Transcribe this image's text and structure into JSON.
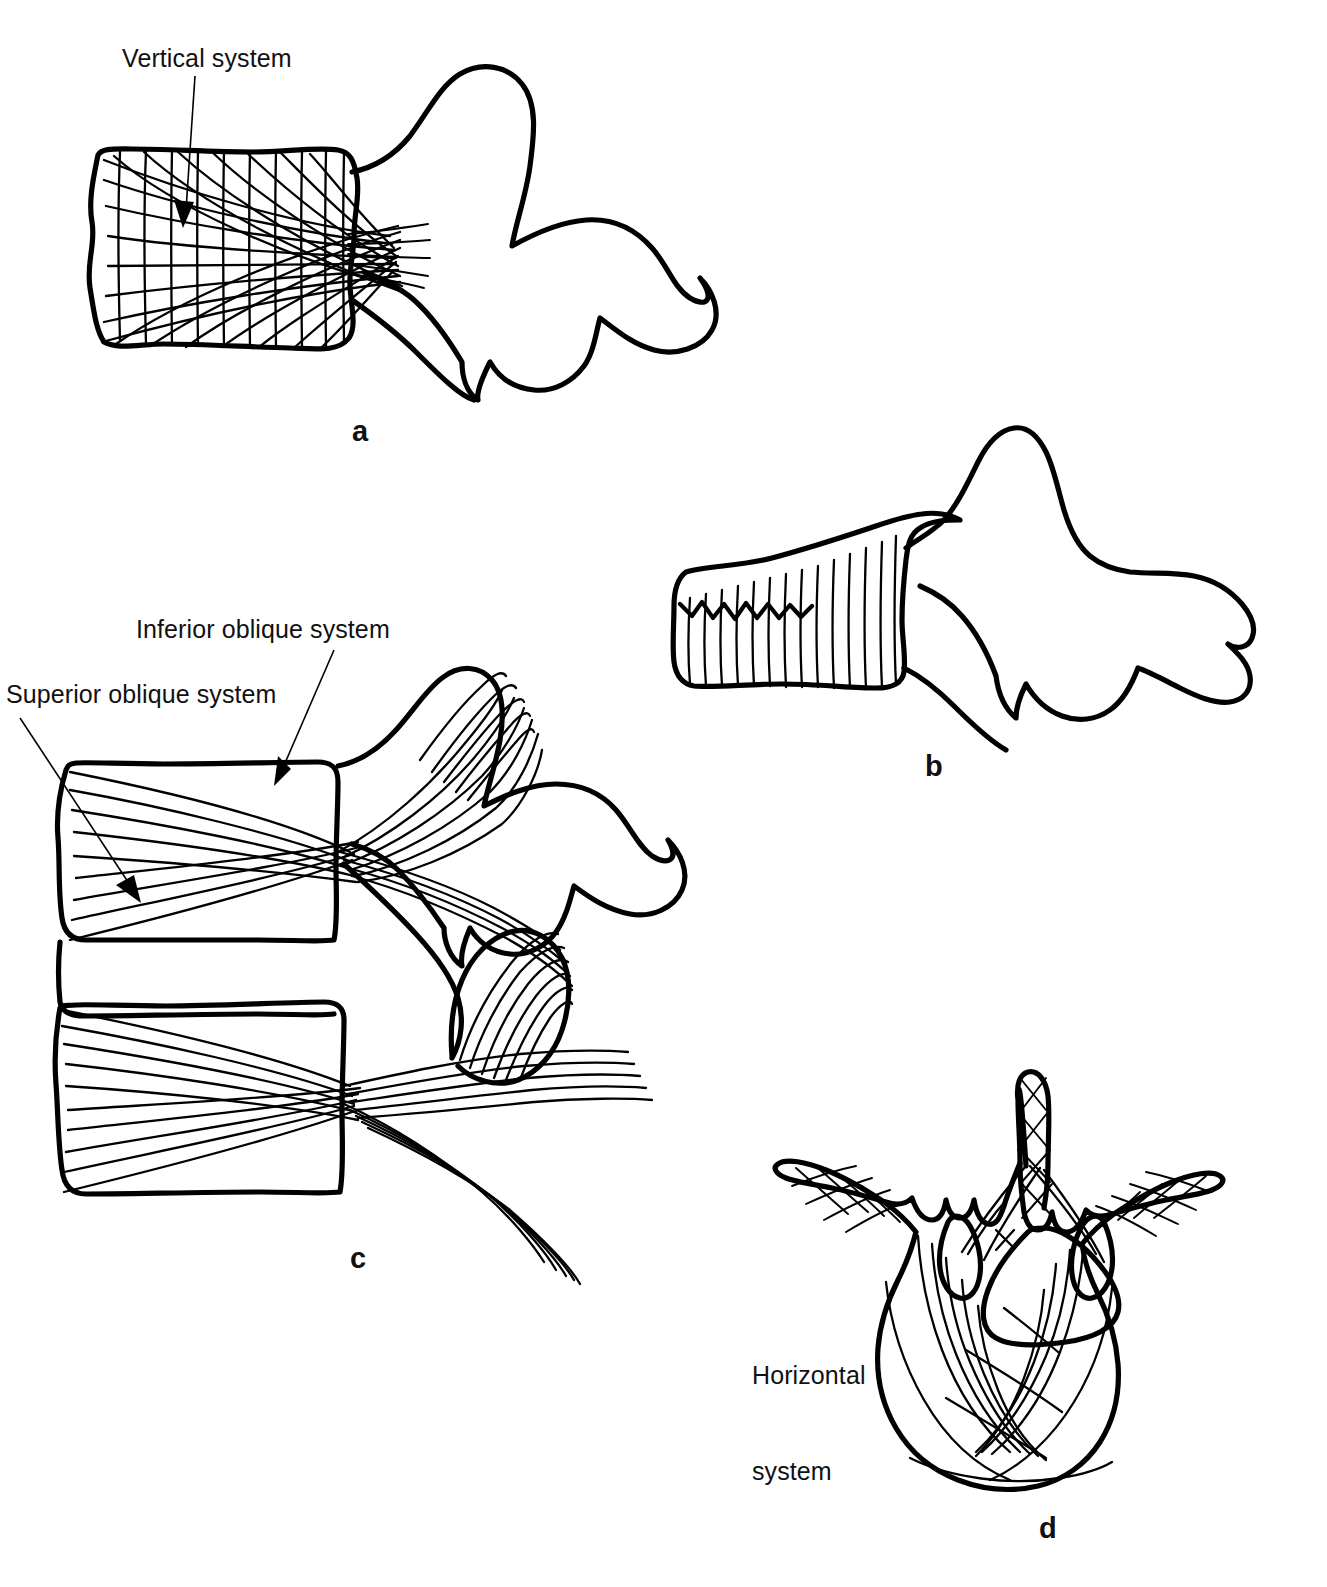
{
  "figure": {
    "background_color": "#ffffff",
    "ink_color": "#000000"
  },
  "callouts": [
    {
      "id": "vertical-system",
      "text": "Vertical system",
      "panel": "a",
      "x": 122,
      "y": 52
    },
    {
      "id": "inferior-oblique-system",
      "text": "Inferior oblique system",
      "panel": "c",
      "x": 136,
      "y": 622
    },
    {
      "id": "superior-oblique-system",
      "text": "Superior oblique system",
      "panel": "c",
      "x": 6,
      "y": 687
    },
    {
      "id": "horizontal-system",
      "text": "Horizontal\nsystem",
      "line1": "Horizontal",
      "line2": "system",
      "panel": "d",
      "x": 752,
      "y": 1304
    }
  ],
  "panels": [
    {
      "id": "panel-a",
      "letter": "a",
      "caption_x": 352,
      "caption_y": 415,
      "description": "Lateral view of vertebra with vertical trabecular system"
    },
    {
      "id": "panel-b",
      "letter": "b",
      "caption_x": 925,
      "caption_y": 750,
      "description": "Lateral view of vertebra with vertical trabeculae only"
    },
    {
      "id": "panel-c",
      "letter": "c",
      "caption_x": 350,
      "caption_y": 1242,
      "description": "Two vertebrae with superior and inferior oblique trabecular systems"
    },
    {
      "id": "panel-d",
      "letter": "d",
      "caption_x": 1039,
      "caption_y": 1512,
      "description": "Axial view of vertebra with horizontal trabecular system"
    }
  ]
}
